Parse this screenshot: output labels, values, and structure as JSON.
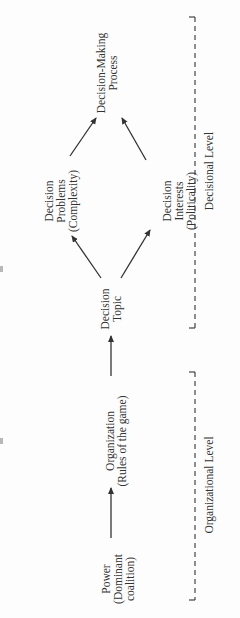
{
  "diagram": {
    "orientation": "rotated-90-ccw",
    "nodes": {
      "power": [
        "Power",
        "(Dominant",
        "coalition)"
      ],
      "organization": [
        "Organization",
        "(Rules of the game)"
      ],
      "decision_topic": [
        "Decision",
        "Topic"
      ],
      "decision_problems": [
        "Decision",
        "Problems",
        "(Complexity)"
      ],
      "decision_interests": [
        "Decision",
        "Interests",
        "(Politicality)"
      ],
      "decision_process": [
        "Decision-Making",
        "Process"
      ]
    },
    "levels": {
      "decisional": "Decisional Level",
      "organizational": "Organizational Level"
    },
    "edges": [
      {
        "from": "Power",
        "to": "Organization"
      },
      {
        "from": "Organization",
        "to": "Decision Topic"
      },
      {
        "from": "Decision Topic",
        "to": "Decision Problems"
      },
      {
        "from": "Decision Topic",
        "to": "Decision Interests"
      },
      {
        "from": "Decision Problems",
        "to": "Decision-Making Process"
      },
      {
        "from": "Decision Interests",
        "to": "Decision-Making Process"
      }
    ],
    "colors": {
      "ink": "#333333",
      "background": "#fdfdfd"
    }
  }
}
